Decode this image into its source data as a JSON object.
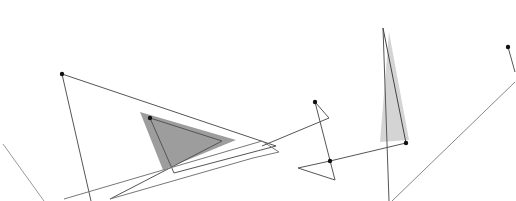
{
  "canvas": {
    "width": 516,
    "height": 201,
    "background": "#ffffff"
  },
  "colors": {
    "line": "#555555",
    "line_light": "#9a9a9a",
    "dark_fill": "#8c8c8c",
    "light_fill": "#cfcfcf",
    "dot": "#111111"
  },
  "shapes": {
    "filled": [
      {
        "name": "dark-shaded-triangle",
        "points": "140,112 236,140 163,170",
        "fill": "#8c8c8c",
        "opacity": 0.85
      },
      {
        "name": "light-shaded-triangle",
        "points": "389,32 409,140 380,142",
        "fill": "#cfcfcf",
        "opacity": 0.9
      }
    ],
    "polylines": [
      {
        "name": "large-outline-triangle",
        "points": "62,74 276,146 174,173 150,118",
        "stroke": "#555555"
      },
      {
        "name": "inner-triangle-edge",
        "points": "150,118 222,141 110,199",
        "stroke": "#555555"
      },
      {
        "name": "left-vertical-edge",
        "points": "62,74 91,201",
        "stroke": "#555555"
      },
      {
        "name": "lower-long-line",
        "points": "64,199 262,141 279,152 253,158 110,199",
        "stroke": "#777777"
      },
      {
        "name": "middle-zigzag",
        "points": "315,102 329,118 262,146",
        "stroke": "#555555"
      },
      {
        "name": "middle-vertical-zigzag",
        "points": "315,102 335,180 298,168 330,161 406,143",
        "stroke": "#555555"
      },
      {
        "name": "tall-thin-line",
        "points": "383,28 389,201",
        "stroke": "#555555"
      },
      {
        "name": "tall-triangle-edge",
        "points": "383,28 406,143",
        "stroke": "#444444"
      },
      {
        "name": "right-short-line",
        "points": "508,47 515,72",
        "stroke": "#555555"
      },
      {
        "name": "right-long-diagonal",
        "points": "515,82 392,201",
        "stroke": "#888888"
      },
      {
        "name": "far-left-diagonal",
        "points": "3,144 44,201",
        "stroke": "#999999"
      }
    ],
    "dots": [
      {
        "name": "vertex-dot-top-left",
        "cx": 62,
        "cy": 74
      },
      {
        "name": "vertex-dot-inner-triangle",
        "cx": 150,
        "cy": 118
      },
      {
        "name": "vertex-dot-middle-top",
        "cx": 315,
        "cy": 102
      },
      {
        "name": "vertex-dot-middle-junction",
        "cx": 330,
        "cy": 161
      },
      {
        "name": "vertex-dot-tall-triangle",
        "cx": 406,
        "cy": 143
      },
      {
        "name": "vertex-dot-right",
        "cx": 508,
        "cy": 47
      }
    ]
  }
}
